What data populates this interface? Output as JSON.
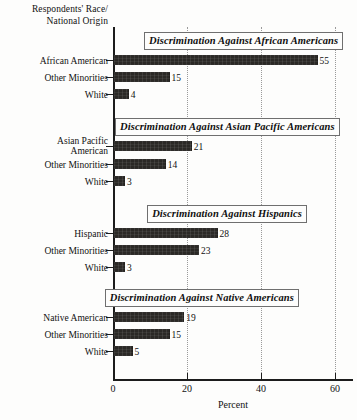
{
  "figure": {
    "y_axis_caption_line1": "Respondents' Race/",
    "y_axis_caption_line2": "National Origin",
    "x_axis_title": "Percent",
    "x_tick_labels": [
      "0",
      "20",
      "40",
      "60"
    ]
  },
  "chart_data": {
    "type": "bar",
    "orientation": "horizontal",
    "title": "",
    "xlabel": "Percent",
    "ylabel": "Respondents' Race/ National Origin",
    "xlim": [
      0,
      60
    ],
    "xticks": [
      0,
      20,
      40,
      60
    ],
    "grid": "vertical-dotted at 20, 40, 60",
    "legend": "none",
    "bar_color": "#2b2926",
    "panels": [
      {
        "title": "Discrimination Against African Americans",
        "categories": [
          "African American",
          "Other Minorities",
          "White"
        ],
        "values": [
          55,
          15,
          4
        ]
      },
      {
        "title": "Discrimination Against Asian Pacific Americans",
        "categories": [
          "Asian Pacific American",
          "Other Minorities",
          "White"
        ],
        "values": [
          21,
          14,
          3
        ]
      },
      {
        "title": "Discrimination Against Hispanics",
        "categories": [
          "Hispanic",
          "Other Minorities",
          "White"
        ],
        "values": [
          28,
          23,
          3
        ]
      },
      {
        "title": "Discrimination Against Native Americans",
        "categories": [
          "Native American",
          "Other Minorities",
          "White"
        ],
        "values": [
          19,
          15,
          5
        ]
      }
    ]
  },
  "layout": {
    "plot_left": 113,
    "plot_top": 27,
    "plot_width": 240,
    "plot_height": 353,
    "px_per_unit": 3.7,
    "panel_title_tops": [
      5,
      91,
      178,
      262
    ],
    "panel_title_aligns": [
      "left-offset",
      "left-offset",
      "right",
      "right"
    ],
    "panel_title_offsets": [
      31,
      2,
      194,
      186
    ],
    "bar_rows_top": [
      28,
      45,
      62,
      114,
      132,
      149,
      201,
      218,
      235,
      285,
      302,
      319
    ],
    "label_two_line_rows": [
      3
    ]
  }
}
